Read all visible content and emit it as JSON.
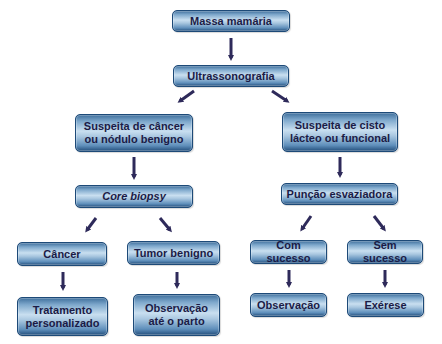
{
  "diagram": {
    "type": "flowchart",
    "colors": {
      "box_edge": "#1d4a78",
      "box_center": "#c9dff0",
      "text": "#1b1b46",
      "arrow": "#2e2a5a"
    },
    "nodes": {
      "massa": {
        "lines": [
          "Massa mamária"
        ]
      },
      "ultrassom": {
        "lines": [
          "Ultrassonografia"
        ]
      },
      "suspeita_cancer": {
        "lines": [
          "Suspeita de câncer",
          "ou nódulo benigno"
        ]
      },
      "suspeita_cisto": {
        "lines": [
          "Suspeita de cisto",
          "lácteo ou funcional"
        ]
      },
      "core_biopsy": {
        "lines": [
          "Core biopsy"
        ]
      },
      "puncao": {
        "lines": [
          "Punção esvaziadora"
        ]
      },
      "cancer": {
        "lines": [
          "Câncer"
        ]
      },
      "tumor_benigno": {
        "lines": [
          "Tumor benigno"
        ]
      },
      "com_sucesso": {
        "lines": [
          "Com sucesso"
        ]
      },
      "sem_sucesso": {
        "lines": [
          "Sem sucesso"
        ]
      },
      "tratamento": {
        "lines": [
          "Tratamento",
          "personalizado"
        ]
      },
      "observacao_parto": {
        "lines": [
          "Observação",
          "até o parto"
        ]
      },
      "observacao": {
        "lines": [
          "Observação"
        ]
      },
      "exerese": {
        "lines": [
          "Exérese"
        ]
      }
    },
    "edges": [
      [
        "massa",
        "ultrassom"
      ],
      [
        "ultrassom",
        "suspeita_cancer"
      ],
      [
        "ultrassom",
        "suspeita_cisto"
      ],
      [
        "suspeita_cancer",
        "core_biopsy"
      ],
      [
        "suspeita_cisto",
        "puncao"
      ],
      [
        "core_biopsy",
        "cancer"
      ],
      [
        "core_biopsy",
        "tumor_benigno"
      ],
      [
        "puncao",
        "com_sucesso"
      ],
      [
        "puncao",
        "sem_sucesso"
      ],
      [
        "cancer",
        "tratamento"
      ],
      [
        "tumor_benigno",
        "observacao_parto"
      ],
      [
        "com_sucesso",
        "observacao"
      ],
      [
        "sem_sucesso",
        "exerese"
      ]
    ]
  }
}
